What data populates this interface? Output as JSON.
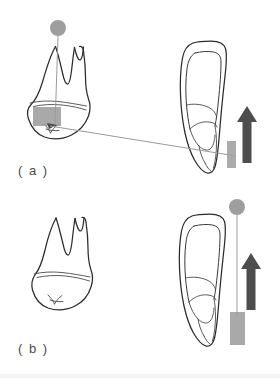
{
  "figure": {
    "background_color": "#ffffff",
    "width": 280,
    "height": 378
  },
  "colors": {
    "outline": "#2b2b2b",
    "inner_detail": "#4a4a4a",
    "guide_line": "#9a9a9a",
    "marker_dot": "#9e9e9e",
    "bracket_fill": "#9a9a9a",
    "arrow_fill": "#4d4d4d",
    "label_text": "#4a4a4a"
  },
  "panels": [
    {
      "id": "panel-a",
      "label": "( a )",
      "label_x": 18,
      "label_y": 175,
      "occlusal_view": {
        "name": "tooth-crown-view-a",
        "description": "molar crown and root frontal view, tilted"
      },
      "lateral_view": {
        "name": "tooth-lateral-view-a",
        "description": "tooth lateral profile with internal pulp outline"
      },
      "marker_dot": {
        "cx": 58,
        "cy": 28,
        "r": 8
      },
      "vertical_guide": {
        "x1": 58,
        "y1": 36,
        "x2": 55,
        "y2": 126
      },
      "diagonal_guide": {
        "x1": 50,
        "y1": 126,
        "x2": 236,
        "y2": 155
      },
      "bracket_main": {
        "x": 33,
        "y": 107,
        "width": 28,
        "height": 19
      },
      "bracket_small": {
        "x": 227,
        "y": 141,
        "width": 9,
        "height": 27
      },
      "force_arrow": {
        "direction": "up",
        "x": 247,
        "y_tip": 106,
        "y_base": 163,
        "shaft_width": 8,
        "head_width": 20
      }
    },
    {
      "id": "panel-b",
      "label": "( b )",
      "label_x": 18,
      "label_y": 353,
      "occlusal_view": {
        "name": "tooth-crown-view-b",
        "description": "molar crown and root frontal view, upright"
      },
      "lateral_view": {
        "name": "tooth-lateral-view-b",
        "description": "tooth lateral profile with internal pulp outline"
      },
      "marker_dot": {
        "cx": 237,
        "cy": 207,
        "r": 8
      },
      "vertical_guide": {
        "x1": 237,
        "y1": 215,
        "x2": 237,
        "y2": 314
      },
      "bracket_main": {
        "x": 230,
        "y": 312,
        "width": 15,
        "height": 33
      },
      "force_arrow": {
        "direction": "up",
        "x": 251,
        "y_tip": 253,
        "y_base": 310,
        "shaft_width": 8,
        "head_width": 20
      }
    }
  ],
  "bottom_caption": {
    "visible": true,
    "text": "",
    "note": "partially cropped line of text at bottom edge"
  }
}
